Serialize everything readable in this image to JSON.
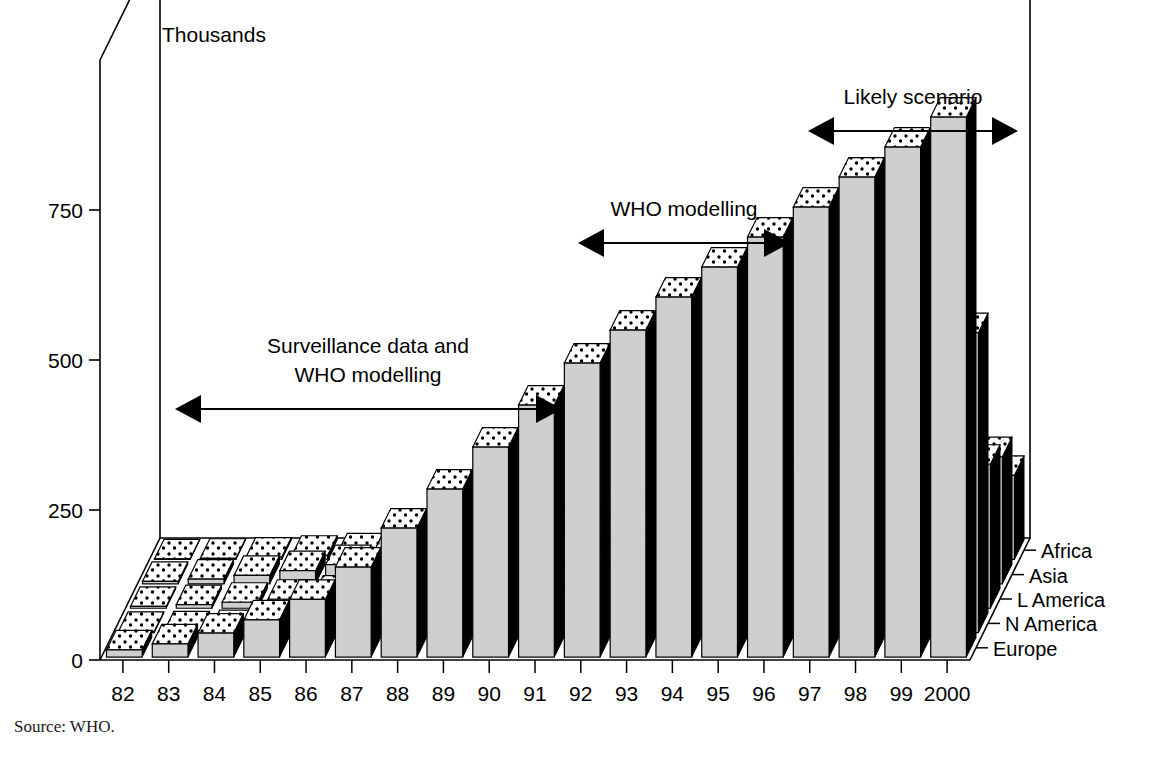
{
  "figure": {
    "y_axis_title": "Thousands",
    "x_axis_title": "Year",
    "source_note": "Source: WHO.",
    "top_cut_text": "",
    "frame_color": "#000000",
    "bar_front_color": "#cfcfcf",
    "bar_side_color": "#000000",
    "bar_top_color": "#ffffff"
  },
  "annotations": [
    {
      "id": "surveillance",
      "label_line1": "Surveillance data and",
      "label_line2": "WHO modelling"
    },
    {
      "id": "who-modelling",
      "label_line1": "WHO modelling",
      "label_line2": ""
    },
    {
      "id": "likely-scenario",
      "label_line1": "Likely scenario",
      "label_line2": ""
    }
  ],
  "chart_data": {
    "type": "bar",
    "title": "",
    "subtitle": "",
    "xlabel": "Year",
    "ylabel": "Thousands",
    "ylim": [
      0,
      1000
    ],
    "yticks": [
      0,
      250,
      500,
      750
    ],
    "ytick_labels": [
      "0",
      "250",
      "500",
      "750"
    ],
    "grid": false,
    "legend_position": "right-depth-axis",
    "projection": "3d",
    "categories": [
      "82",
      "83",
      "84",
      "85",
      "86",
      "87",
      "88",
      "89",
      "90",
      "91",
      "92",
      "93",
      "94",
      "95",
      "96",
      "97",
      "98",
      "99",
      "2000"
    ],
    "series": [
      {
        "name": "Africa",
        "values": [
          12,
          22,
          40,
          62,
          96,
          150,
          215,
          280,
          350,
          420,
          490,
          545,
          600,
          650,
          700,
          750,
          800,
          850,
          900
        ]
      },
      {
        "name": "Asia",
        "values": [
          2,
          3,
          5,
          8,
          12,
          18,
          26,
          38,
          55,
          80,
          110,
          140,
          175,
          215,
          260,
          310,
          370,
          430,
          500
        ]
      },
      {
        "name": "L America",
        "values": [
          3,
          6,
          10,
          15,
          22,
          32,
          45,
          60,
          78,
          96,
          115,
          132,
          150,
          168,
          185,
          200,
          215,
          228,
          240
        ]
      },
      {
        "name": "N America",
        "values": [
          4,
          8,
          14,
          22,
          32,
          45,
          58,
          72,
          88,
          102,
          118,
          132,
          146,
          158,
          170,
          182,
          192,
          202,
          212
        ]
      },
      {
        "name": "Europe",
        "values": [
          1,
          2,
          4,
          7,
          11,
          16,
          23,
          31,
          40,
          50,
          60,
          70,
          80,
          90,
          100,
          110,
          120,
          130,
          140
        ]
      }
    ]
  }
}
